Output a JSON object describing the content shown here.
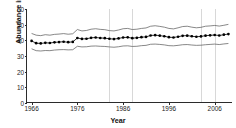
{
  "chart_data": {
    "type": "line",
    "title": "",
    "xlabel": "Year",
    "ylabel": "Abundance index",
    "xlim": [
      1965,
      2010
    ],
    "ylim": [
      0,
      60
    ],
    "grid": "vertical-only",
    "legend": "none",
    "xticks": [
      1966,
      1976,
      1986,
      1996,
      2006
    ],
    "xtick_labels": [
      "1966",
      "1976",
      "1986",
      "1996",
      "2006"
    ],
    "yticks": [
      0,
      10,
      20,
      30,
      40,
      50,
      60
    ],
    "ytick_labels": [
      "0",
      "10",
      "20",
      "30",
      "40",
      "50",
      "60"
    ],
    "gridlines_x": [
      1983,
      1988,
      2003,
      2006
    ],
    "x": [
      1966,
      1967,
      1968,
      1969,
      1970,
      1971,
      1972,
      1973,
      1974,
      1975,
      1976,
      1977,
      1978,
      1979,
      1980,
      1981,
      1982,
      1983,
      1984,
      1985,
      1986,
      1987,
      1988,
      1989,
      1990,
      1991,
      1992,
      1993,
      1994,
      1995,
      1996,
      1997,
      1998,
      1999,
      2000,
      2001,
      2002,
      2003,
      2004,
      2005,
      2006,
      2007,
      2008,
      2009
    ],
    "series": [
      {
        "name": "Abundance index",
        "style": "dotted-markers-with-line",
        "color": "#000000",
        "values": [
          39.6,
          38.2,
          38.0,
          38.4,
          38.3,
          38.7,
          38.9,
          39.1,
          38.8,
          39.0,
          41.5,
          40.9,
          41.0,
          41.6,
          41.8,
          41.5,
          41.4,
          41.0,
          40.8,
          41.2,
          41.8,
          41.9,
          41.4,
          41.6,
          42.0,
          42.2,
          43.1,
          43.3,
          43.0,
          42.6,
          42.0,
          41.8,
          42.3,
          42.9,
          43.0,
          42.6,
          42.3,
          42.5,
          43.0,
          43.2,
          43.4,
          43.1,
          43.6,
          44.0
        ]
      },
      {
        "name": "Upper confidence limit",
        "style": "thin-line",
        "color": "#555555",
        "values": [
          44.4,
          43.3,
          43.0,
          43.6,
          43.3,
          43.8,
          44.0,
          44.3,
          43.9,
          44.2,
          46.9,
          46.0,
          46.3,
          47.1,
          47.4,
          47.0,
          46.8,
          46.2,
          46.0,
          46.6,
          47.4,
          47.6,
          46.9,
          47.1,
          47.6,
          47.9,
          49.0,
          49.3,
          48.9,
          48.4,
          47.6,
          47.3,
          48.0,
          48.8,
          49.0,
          48.4,
          48.0,
          48.3,
          49.0,
          49.2,
          49.5,
          49.1,
          49.6,
          50.2
        ]
      },
      {
        "name": "Lower confidence limit",
        "style": "thin-line",
        "color": "#555555",
        "values": [
          34.6,
          33.4,
          33.2,
          33.5,
          33.4,
          33.8,
          34.0,
          34.1,
          33.9,
          34.0,
          36.2,
          35.8,
          35.9,
          36.3,
          36.4,
          36.2,
          36.1,
          35.8,
          35.6,
          35.9,
          36.4,
          36.5,
          36.1,
          36.2,
          36.6,
          36.8,
          37.5,
          37.6,
          37.4,
          37.1,
          36.6,
          36.5,
          36.8,
          37.2,
          37.3,
          37.0,
          36.8,
          36.9,
          37.2,
          37.4,
          37.6,
          37.3,
          37.7,
          38.0
        ]
      }
    ]
  }
}
